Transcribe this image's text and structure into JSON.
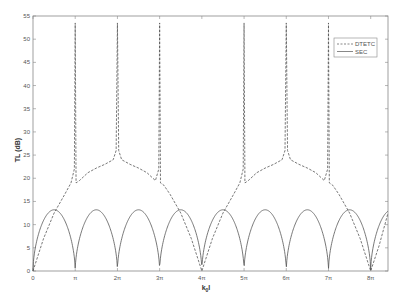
{
  "chart_data": {
    "type": "line",
    "title": "",
    "xlabel": "k_0 l",
    "ylabel": "TL (dB)",
    "xlim": [
      0,
      26.42
    ],
    "ylim": [
      0,
      55
    ],
    "grid": false,
    "legend_position": "upper right",
    "xticks": [
      {
        "value": 0,
        "label": "0"
      },
      {
        "value": 3.1416,
        "label": "π"
      },
      {
        "value": 6.2832,
        "label": "2π"
      },
      {
        "value": 9.4248,
        "label": "3π"
      },
      {
        "value": 12.5664,
        "label": "4π"
      },
      {
        "value": 15.708,
        "label": "5π"
      },
      {
        "value": 18.8496,
        "label": "6π"
      },
      {
        "value": 21.9911,
        "label": "7π"
      },
      {
        "value": 25.1327,
        "label": "8π"
      }
    ],
    "yticks": [
      0,
      5,
      10,
      15,
      20,
      25,
      30,
      35,
      40,
      45,
      50,
      55
    ],
    "series": [
      {
        "name": "DTETC",
        "style": "dashed",
        "color": "#555555",
        "x_pi": [
          0,
          0.25,
          0.5,
          0.75,
          0.9,
          0.98,
          1.0,
          1.02,
          1.1,
          1.3,
          1.5,
          1.7,
          1.9,
          1.97,
          2.0,
          2.03,
          2.1,
          2.3,
          2.5,
          2.7,
          2.9,
          2.98,
          3.0,
          3.02,
          3.1,
          3.25,
          3.5,
          3.75,
          4.0,
          4.25,
          4.5,
          4.75,
          4.9,
          4.98,
          5.0,
          5.02,
          5.1,
          5.3,
          5.5,
          5.7,
          5.9,
          5.97,
          6.0,
          6.03,
          6.1,
          6.3,
          6.5,
          6.7,
          6.9,
          6.98,
          7.0,
          7.02,
          7.1,
          7.25,
          7.5,
          7.75,
          8.0,
          8.2,
          8.41
        ],
        "values": [
          0,
          7,
          12.5,
          16.5,
          19,
          22,
          53.5,
          19,
          19.5,
          21.2,
          22.2,
          23.0,
          24.0,
          26,
          53.5,
          26,
          24.0,
          23.0,
          22.2,
          21.2,
          19.5,
          22,
          53.5,
          19,
          18.5,
          16.5,
          12.5,
          7,
          0,
          7,
          12.5,
          16.5,
          19,
          22,
          53.5,
          19,
          19.5,
          21.2,
          22.2,
          23.0,
          24.0,
          26,
          53.5,
          26,
          24.0,
          23.0,
          22.2,
          21.2,
          19.5,
          22,
          53.5,
          19,
          18.5,
          16.5,
          12.5,
          7,
          0,
          5.5,
          12.5
        ]
      },
      {
        "name": "SEC",
        "style": "solid",
        "color": "#555555",
        "description": "|sin|-shaped arches: 0 at each multiple of π, peak ≈13.2 dB at odd multiples of π/2",
        "peak": 13.2,
        "period_pi": 1
      }
    ]
  },
  "legend": {
    "items": [
      {
        "label": "DTETC",
        "style": "dashed"
      },
      {
        "label": "SEC",
        "style": "solid"
      }
    ]
  },
  "axes": {
    "x_label_main": "k",
    "x_label_sub": "0",
    "x_label_tail": "l",
    "y_label": "TL (dB)"
  }
}
